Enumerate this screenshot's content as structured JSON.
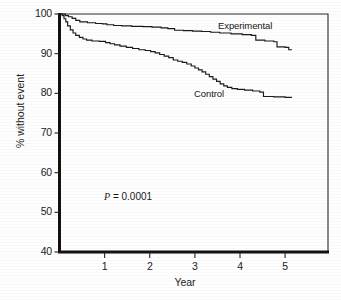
{
  "chart_data": {
    "type": "line",
    "title": "",
    "subtitle": "",
    "xlabel": "Year",
    "ylabel": "% without event",
    "xlim": [
      0,
      5.95
    ],
    "ylim": [
      40,
      100
    ],
    "xticks": [
      1,
      2,
      3,
      4,
      5
    ],
    "xtick_labels": [
      "1",
      "2",
      "3",
      "4",
      "5"
    ],
    "yticks": [
      40,
      50,
      60,
      70,
      80,
      90,
      100
    ],
    "ytick_labels": [
      "40",
      "50",
      "60",
      "70",
      "80",
      "90",
      "100"
    ],
    "grid": false,
    "legend_position": "inline-annotation",
    "annotations": [
      {
        "name": "p-value",
        "text": "P = 0.0001",
        "x": 1.0,
        "y": 54
      }
    ],
    "series": [
      {
        "name": "Experimental",
        "label": "Experimental",
        "color": "#1a1a1a",
        "step": "post",
        "label_x": 3.55,
        "label_y": 96.4,
        "points": [
          [
            0.0,
            100.0
          ],
          [
            0.1,
            100.0
          ],
          [
            0.13,
            99.6
          ],
          [
            0.2,
            99.3
          ],
          [
            0.28,
            98.9
          ],
          [
            0.36,
            98.4
          ],
          [
            0.45,
            98.0
          ],
          [
            0.62,
            97.8
          ],
          [
            0.8,
            97.6
          ],
          [
            0.95,
            97.5
          ],
          [
            1.05,
            97.3
          ],
          [
            1.2,
            97.1
          ],
          [
            1.38,
            97.0
          ],
          [
            1.6,
            96.9
          ],
          [
            1.85,
            96.8
          ],
          [
            2.05,
            96.7
          ],
          [
            2.25,
            96.5
          ],
          [
            2.4,
            96.3
          ],
          [
            2.55,
            95.9
          ],
          [
            2.75,
            95.8
          ],
          [
            2.95,
            95.7
          ],
          [
            3.15,
            95.6
          ],
          [
            3.35,
            95.4
          ],
          [
            3.55,
            95.2
          ],
          [
            3.8,
            95.0
          ],
          [
            4.05,
            94.8
          ],
          [
            4.25,
            94.6
          ],
          [
            4.35,
            93.4
          ],
          [
            4.55,
            93.2
          ],
          [
            4.75,
            93.0
          ],
          [
            4.82,
            91.7
          ],
          [
            5.0,
            91.6
          ],
          [
            5.08,
            91.0
          ],
          [
            5.15,
            91.0
          ]
        ]
      },
      {
        "name": "Control",
        "label": "Control",
        "color": "#1a1a1a",
        "step": "post",
        "label_x": 2.95,
        "label_y": 80.6,
        "points": [
          [
            0.0,
            100.0
          ],
          [
            0.06,
            99.6
          ],
          [
            0.1,
            98.8
          ],
          [
            0.14,
            98.0
          ],
          [
            0.18,
            97.0
          ],
          [
            0.24,
            96.0
          ],
          [
            0.3,
            95.2
          ],
          [
            0.36,
            94.6
          ],
          [
            0.44,
            94.1
          ],
          [
            0.52,
            93.7
          ],
          [
            0.6,
            93.4
          ],
          [
            0.72,
            93.2
          ],
          [
            0.88,
            93.1
          ],
          [
            1.02,
            92.8
          ],
          [
            1.12,
            92.5
          ],
          [
            1.22,
            92.2
          ],
          [
            1.34,
            91.9
          ],
          [
            1.48,
            91.6
          ],
          [
            1.62,
            91.3
          ],
          [
            1.76,
            91.0
          ],
          [
            1.9,
            90.8
          ],
          [
            2.02,
            90.5
          ],
          [
            2.12,
            90.2
          ],
          [
            2.22,
            89.8
          ],
          [
            2.32,
            89.4
          ],
          [
            2.42,
            89.0
          ],
          [
            2.52,
            88.4
          ],
          [
            2.62,
            88.1
          ],
          [
            2.72,
            87.8
          ],
          [
            2.82,
            87.4
          ],
          [
            2.92,
            86.9
          ],
          [
            3.0,
            86.4
          ],
          [
            3.08,
            85.9
          ],
          [
            3.16,
            85.4
          ],
          [
            3.24,
            84.8
          ],
          [
            3.32,
            84.2
          ],
          [
            3.4,
            83.6
          ],
          [
            3.48,
            83.0
          ],
          [
            3.56,
            82.4
          ],
          [
            3.64,
            81.9
          ],
          [
            3.72,
            81.5
          ],
          [
            3.82,
            81.2
          ],
          [
            3.94,
            81.0
          ],
          [
            4.1,
            80.8
          ],
          [
            4.28,
            80.6
          ],
          [
            4.44,
            80.3
          ],
          [
            4.52,
            79.2
          ],
          [
            4.75,
            79.1
          ],
          [
            5.0,
            79.0
          ],
          [
            5.15,
            79.0
          ]
        ]
      }
    ]
  },
  "axes": {
    "y_axis_label": "% without event",
    "x_axis_label": "Year"
  }
}
